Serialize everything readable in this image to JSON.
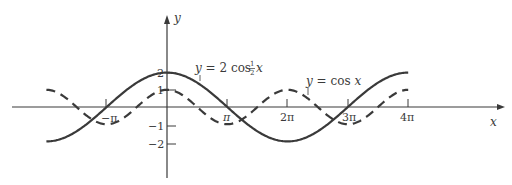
{
  "chart_data": {
    "type": "line",
    "title": "",
    "xlabel": "x",
    "ylabel": "y",
    "x_ticks": [
      "−π",
      "π",
      "2π",
      "3π",
      "4π"
    ],
    "x_tick_values": [
      -3.14159,
      3.14159,
      6.28318,
      9.42478,
      12.56637
    ],
    "y_ticks": [
      "2",
      "1",
      "−1",
      "−2"
    ],
    "y_tick_values": [
      2,
      1,
      -1,
      -2
    ],
    "xlim": [
      -6.28318,
      12.56637
    ],
    "ylim": [
      -2,
      2
    ],
    "grid": false,
    "legend": "inline annotations",
    "series": [
      {
        "name": "y = 2 cos ½ x",
        "function": "2*cos(x/2)",
        "style": "solid",
        "x": [
          -6.28318,
          -3.14159,
          0,
          3.14159,
          6.28318,
          9.42478,
          12.56637
        ],
        "values": [
          -2,
          0,
          2,
          0,
          -2,
          0,
          2
        ]
      },
      {
        "name": "y = cos x",
        "function": "cos(x)",
        "style": "dashed",
        "x": [
          -6.28318,
          -3.14159,
          0,
          3.14159,
          6.28318,
          9.42478,
          12.56637
        ],
        "values": [
          1,
          -1,
          1,
          -1,
          1,
          -1,
          1
        ]
      }
    ],
    "annotations": [
      {
        "text": "y = 2 cos ½ x",
        "series": 0
      },
      {
        "text": "y = cos x",
        "series": 1
      }
    ]
  },
  "labels": {
    "x_axis": "x",
    "y_axis": "y",
    "xtick_neg_pi": "−π",
    "xtick_pi": "π",
    "xtick_2pi": "2π",
    "xtick_3pi": "3π",
    "xtick_4pi": "4π",
    "ytick_2": "2",
    "ytick_1": "1",
    "ytick_neg1": "−1",
    "ytick_neg2": "−2",
    "ann1_prefix": "y",
    "ann1_eq": " = 2 cos ",
    "ann1_num": "1",
    "ann1_den": "2",
    "ann1_var": " x",
    "ann2_prefix": "y",
    "ann2_eq": " = cos ",
    "ann2_var": "x"
  },
  "colors": {
    "curve": "#3a3a3a",
    "axis": "#3a3a3a",
    "background": "#ffffff"
  }
}
